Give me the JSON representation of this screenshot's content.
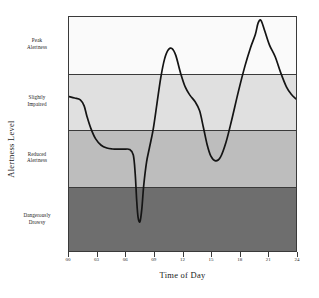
{
  "chart_data": {
    "type": "line",
    "title": "",
    "xlabel": "Time of Day",
    "ylabel": "Alertness Level",
    "xlim": [
      0,
      24
    ],
    "ylim": [
      0,
      100
    ],
    "grid": false,
    "legend": "none",
    "x_ticks": [
      "00",
      "03",
      "06",
      "09",
      "12",
      "15",
      "18",
      "21",
      "24"
    ],
    "x_tick_values": [
      0,
      3,
      6,
      9,
      12,
      15,
      18,
      21,
      24
    ],
    "bands": [
      {
        "label": "Peak\nAlertness",
        "label_flat": "Peak Alertness",
        "range": [
          76,
          100
        ],
        "color": "#fafafa"
      },
      {
        "label": "Slightly\nImpaired",
        "label_flat": "Slightly Impaired",
        "range": [
          52,
          76
        ],
        "color": "#e0e0e0"
      },
      {
        "label": "Reduced\nAlertness",
        "label_flat": "Reduced Alertness",
        "range": [
          28,
          52
        ],
        "color": "#bdbdbd"
      },
      {
        "label": "Dangerously\nDrowsy",
        "label_flat": "Dangerously Drowsy",
        "range": [
          0,
          28
        ],
        "color": "#6e6e6e"
      }
    ],
    "series": [
      {
        "name": "Alertness",
        "color": "#141414",
        "x": [
          0.0,
          0.6,
          1.2,
          1.6,
          1.9,
          2.3,
          2.8,
          3.4,
          4.0,
          4.6,
          5.2,
          5.8,
          6.4,
          6.8,
          7.0,
          7.15,
          7.3,
          7.5,
          7.7,
          7.9,
          8.2,
          8.5,
          8.9,
          9.3,
          9.7,
          10.1,
          10.5,
          10.9,
          11.3,
          11.8,
          12.3,
          12.8,
          13.3,
          13.8,
          14.2,
          14.6,
          15.0,
          15.5,
          16.0,
          16.6,
          17.2,
          17.9,
          18.6,
          19.2,
          19.7,
          20.0,
          20.3,
          20.7,
          21.2,
          21.8,
          22.4,
          23.0,
          23.5,
          24.0
        ],
        "y": [
          66.0,
          65.4,
          64.6,
          62.0,
          57.5,
          52.5,
          48.0,
          45.2,
          44.0,
          43.6,
          43.5,
          43.5,
          43.4,
          41.0,
          33.0,
          22.0,
          14.5,
          12.5,
          18.0,
          28.0,
          38.0,
          44.0,
          52.0,
          63.0,
          74.0,
          82.0,
          86.0,
          86.5,
          83.5,
          76.0,
          70.0,
          66.5,
          64.0,
          60.0,
          53.0,
          45.5,
          40.5,
          38.5,
          40.0,
          46.5,
          56.0,
          68.0,
          79.0,
          87.0,
          92.5,
          97.5,
          98.5,
          94.0,
          88.0,
          83.0,
          76.0,
          70.0,
          67.0,
          65.0
        ]
      }
    ]
  },
  "axes": {
    "y_title": "Alertness Level",
    "x_title": "Time of Day"
  }
}
